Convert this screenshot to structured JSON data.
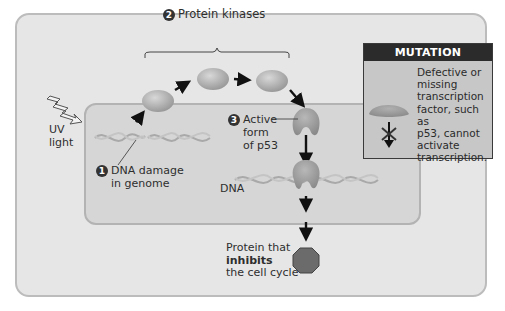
{
  "figure": {
    "steps": [
      {
        "number": "1",
        "label_line1": "DNA damage",
        "label_line2": "in genome"
      },
      {
        "number": "2",
        "label": "Protein kinases"
      },
      {
        "number": "3",
        "label_line1": "Active",
        "label_line2": "form",
        "label_line3": "of p53"
      }
    ],
    "uv_label_line1": "UV",
    "uv_label_line2": "light",
    "dna_label": "DNA",
    "output_label_line1": "Protein that",
    "output_label_line2": "inhibits",
    "output_label_line3": "the cell cycle"
  },
  "mutation_box": {
    "header": "MUTATION",
    "text": "Defective or\nmissing\ntranscription\nfactor, such as\np53, cannot\nactivate\ntranscription."
  },
  "colors": {
    "frame_bg": "#e6e6e6",
    "nucleus_bg": "#d6d6d6",
    "protein": "#a8a8a8",
    "inhibitor": "#6b6b6b",
    "mutation_header": "#2b2b2b",
    "mutation_bg": "#c7c7c7"
  },
  "icons": {
    "uv": "zigzag-lightning-icon",
    "kinase": "ellipse-protein-icon",
    "p53": "bean-protein-icon",
    "inhibitor": "octagon-icon",
    "blocked": "x-arrow-icon"
  }
}
